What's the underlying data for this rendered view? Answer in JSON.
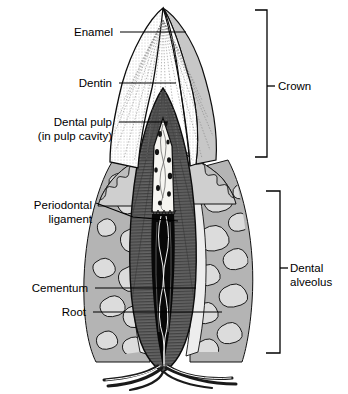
{
  "figure": {
    "background_color": "#ffffff",
    "line_color": "#000000"
  },
  "labels_left": [
    {
      "id": "enamel",
      "text": "Enamel",
      "text2": "",
      "x": 113,
      "y": 32,
      "leader": [
        120,
        32,
        186,
        32
      ],
      "leader2": []
    },
    {
      "id": "dentin",
      "text": "Dentin",
      "text2": "",
      "x": 112,
      "y": 83,
      "leader": [
        119,
        83,
        176,
        83
      ],
      "leader2": []
    },
    {
      "id": "dental-pulp",
      "text": "Dental pulp",
      "text2": "(in pulp cavity)",
      "x": 112,
      "y": 122,
      "leader": [
        119,
        122,
        168,
        122
      ],
      "leader2": []
    },
    {
      "id": "periodontal-ligament",
      "text": "Periodontal",
      "text2": "ligament",
      "x": 92,
      "y": 205,
      "leader": [
        96,
        203,
        133,
        217
      ],
      "leader2": [
        133,
        217,
        178,
        221
      ]
    },
    {
      "id": "cementum",
      "text": "Cementum",
      "text2": "",
      "x": 88,
      "y": 288,
      "leader": [
        95,
        288,
        196,
        288
      ],
      "leader2": []
    },
    {
      "id": "root",
      "text": "Root",
      "text2": "",
      "x": 86,
      "y": 312,
      "leader": [
        93,
        312,
        222,
        312
      ],
      "leader2": []
    }
  ],
  "labels_right": [
    {
      "id": "crown",
      "text": "Crown",
      "text2": "",
      "x": 278,
      "y": 86,
      "bracket": {
        "x": 267,
        "top": 10,
        "bottom": 157,
        "arm": 12,
        "tick_y": 86,
        "tick_x2": 275
      }
    },
    {
      "id": "dental-alveolus",
      "text": "Dental",
      "text2": "alveolus",
      "x": 290,
      "y": 268,
      "bracket": {
        "x": 280,
        "top": 191,
        "bottom": 353,
        "arm": 14,
        "tick_y": 268,
        "tick_x2": 288
      }
    }
  ],
  "structures": [
    {
      "name": "enamel",
      "description": "outer cut enamel cap, white with radial striations",
      "color": "#ffffff"
    },
    {
      "name": "enamel-uncut",
      "description": "intact enamel surface on right of crown",
      "color": "#c9c9c9"
    },
    {
      "name": "dentin",
      "description": "dark gray dentin cone with fine radial hatching",
      "color": "#5a5a5a"
    },
    {
      "name": "pulp-cavity",
      "description": "white pulp chamber with dark vessel spots",
      "color": "#f5f5f2"
    },
    {
      "name": "root-canal",
      "description": "black root canal containing vessels and nerves",
      "color": "#000000"
    },
    {
      "name": "gingiva",
      "description": "gum tissue, light gray with scalloped margin",
      "color": "#d2d2d2"
    },
    {
      "name": "alveolar-bone",
      "description": "jaw bone with trabecular pattern",
      "color": "#b8b8b8"
    },
    {
      "name": "trabeculae",
      "description": "light marrow spaces within bone",
      "color": "#dcdcdc"
    },
    {
      "name": "periodontal-ligament",
      "description": "thin light band between cementum and bone",
      "color": "#ededed"
    },
    {
      "name": "cementum",
      "description": "thin dark layer coating the root",
      "color": "#2e2e2e"
    },
    {
      "name": "vessels-nerves",
      "description": "blood vessels and nerves entering the apex",
      "color": "#3a3a3a"
    }
  ]
}
